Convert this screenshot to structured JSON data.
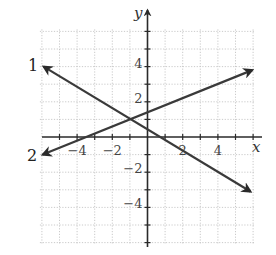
{
  "chart_data": {
    "type": "line",
    "title": "",
    "xlabel": "x",
    "ylabel": "y",
    "xlim": [
      -6,
      6
    ],
    "ylim": [
      -6,
      6
    ],
    "grid": true,
    "grid_step": 1,
    "x_tick_labels": [
      {
        "value": -4,
        "label": "−4"
      },
      {
        "value": -2,
        "label": "−2"
      },
      {
        "value": 2,
        "label": "2"
      },
      {
        "value": 4,
        "label": "4"
      }
    ],
    "y_tick_labels": [
      {
        "value": 4,
        "label": "4"
      },
      {
        "value": 2,
        "label": "2"
      },
      {
        "value": -2,
        "label": "−2"
      },
      {
        "value": -4,
        "label": "−4"
      }
    ],
    "series": [
      {
        "name": "1",
        "label": "1",
        "equation_estimate": "y = -0.6x + 0.4",
        "points": [
          [
            -5.9,
            4.0
          ],
          [
            5.85,
            -3.1
          ]
        ],
        "arrows": "both"
      },
      {
        "name": "2",
        "label": "2",
        "equation_estimate": "y = 0.4x + 1.4",
        "points": [
          [
            -5.95,
            -1.0
          ],
          [
            5.95,
            3.8
          ]
        ],
        "arrows": "both"
      }
    ],
    "annotations": [
      {
        "type": "intersection",
        "point": [
          -1,
          1
        ]
      }
    ]
  },
  "labels": {
    "x_axis": "x",
    "y_axis": "y",
    "line1": "1",
    "line2": "2"
  }
}
